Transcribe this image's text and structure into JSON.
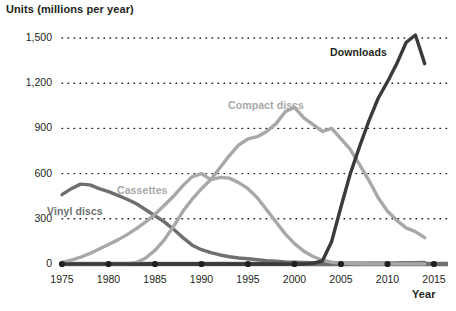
{
  "chart_data": {
    "type": "line",
    "title": "",
    "ylabel": "Units (millions per year)",
    "xlabel": "Year",
    "xlim": [
      1975,
      2015
    ],
    "ylim": [
      0,
      1500
    ],
    "grid": "horizontal-dotted",
    "legend_position": "inline-labels",
    "x_ticks": [
      "1975",
      "1980",
      "1985",
      "1990",
      "1995",
      "2000",
      "2005",
      "2010",
      "2015"
    ],
    "y_ticks": [
      "0",
      "300",
      "600",
      "900",
      "1,200",
      "1,500"
    ],
    "x": [
      1975,
      1976,
      1977,
      1978,
      1979,
      1980,
      1981,
      1982,
      1983,
      1984,
      1985,
      1986,
      1987,
      1988,
      1989,
      1990,
      1991,
      1992,
      1993,
      1994,
      1995,
      1996,
      1997,
      1998,
      1999,
      2000,
      2001,
      2002,
      2003,
      2004,
      2005,
      2006,
      2007,
      2008,
      2009,
      2010,
      2011,
      2012,
      2013,
      2014
    ],
    "series": [
      {
        "name": "Vinyl discs",
        "color": "#6f6f6f",
        "label_x": 47,
        "label_y": 205,
        "values": [
          460,
          500,
          530,
          525,
          500,
          480,
          455,
          430,
          400,
          360,
          320,
          280,
          230,
          175,
          125,
          95,
          75,
          60,
          48,
          40,
          35,
          28,
          22,
          18,
          14,
          12,
          10,
          8,
          7,
          6,
          5,
          5,
          5,
          5,
          5,
          6,
          7,
          8,
          9,
          10
        ]
      },
      {
        "name": "Cassettes",
        "color": "#a8a8a8",
        "label_x": 117,
        "label_y": 184,
        "values": [
          10,
          25,
          45,
          70,
          100,
          130,
          160,
          195,
          235,
          280,
          330,
          390,
          450,
          520,
          580,
          600,
          560,
          575,
          570,
          540,
          500,
          440,
          360,
          280,
          200,
          135,
          85,
          50,
          25,
          12,
          6,
          3,
          2,
          1,
          1,
          1,
          1,
          1,
          1,
          1
        ]
      },
      {
        "name": "Compact discs",
        "color": "#a8a8a8",
        "label_x": 228,
        "label_y": 99,
        "values": [
          0,
          0,
          0,
          0,
          0,
          0,
          0,
          0,
          10,
          40,
          90,
          160,
          250,
          350,
          430,
          500,
          560,
          640,
          720,
          790,
          830,
          845,
          880,
          930,
          1010,
          1040,
          970,
          925,
          880,
          900,
          830,
          760,
          660,
          555,
          440,
          350,
          290,
          240,
          215,
          175
        ]
      },
      {
        "name": "Downloads",
        "color": "#3a3a3a",
        "label_x": 330,
        "label_y": 46,
        "values": [
          0,
          0,
          0,
          0,
          0,
          0,
          0,
          0,
          0,
          0,
          0,
          0,
          0,
          0,
          0,
          0,
          0,
          0,
          0,
          0,
          0,
          0,
          0,
          0,
          0,
          0,
          0,
          5,
          20,
          150,
          380,
          600,
          780,
          950,
          1100,
          1210,
          1330,
          1470,
          1520,
          1330
        ]
      }
    ],
    "axis_marker_years": [
      1975,
      1980,
      1985,
      1990,
      1995,
      2000,
      2005,
      2010,
      2015
    ],
    "colors": {
      "axis": "#231f20",
      "gridline": "#231f20",
      "baseline": "#6f6f6f",
      "text": "#231f20"
    }
  }
}
